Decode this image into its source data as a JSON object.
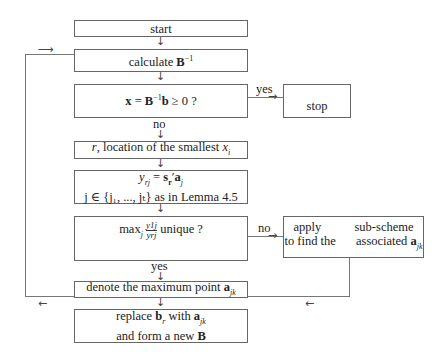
{
  "diagram": {
    "type": "flowchart",
    "nodes": {
      "start": {
        "label": "start"
      },
      "calc_binv": {
        "label_prefix": "calculate ",
        "label_math": "B",
        "label_sup": "−1"
      },
      "test_x": {
        "label": "x = B⁻¹b ≥ 0 ?",
        "lhs": "x",
        "eq": " = ",
        "B": "B",
        "sup": "−1",
        "b": "b",
        "rest": " ≥ 0 ?"
      },
      "stop": {
        "label": "stop"
      },
      "smallest": {
        "r": "r",
        "text": ", location of the smallest ",
        "x": "x",
        "sub": "i"
      },
      "yrj": {
        "line1_y": "y",
        "line1_sub": "rj",
        "line1_eq": " = ",
        "line1_s": "s",
        "line1_ssub": "r",
        "line1_prime": "′",
        "line1_a": "a",
        "line1_asub": "j",
        "line2": "j ∈ {j₁, ..., jₜ} as in Lemma 4.5"
      },
      "max_unique": {
        "max": "max",
        "max_sub": "j",
        "num": "y1j",
        "den": "yrj",
        "rest": " unique ?"
      },
      "subscheme": {
        "line1_left": "apply",
        "line1_right": "sub-scheme",
        "line2_left": "to find the",
        "line2_right": "associated",
        "a": "a",
        "asub": "jk"
      },
      "denote": {
        "text": "denote the maximum point ",
        "a": "a",
        "asub": "jk"
      },
      "replace": {
        "line1_pre": "replace ",
        "b": "b",
        "bsub": "r",
        "line1_mid": " with ",
        "a": "a",
        "asub": "jk",
        "line2_pre": "and form a new ",
        "B": "B"
      }
    },
    "edge_labels": {
      "yes_stop": "yes",
      "no_smallest": "no",
      "no_subscheme": "no",
      "yes_denote": "yes"
    },
    "arrows": {
      "down": "↓",
      "right": "→",
      "left": "←",
      "loop_in": "⟶",
      "loop_out": "⟵"
    }
  }
}
